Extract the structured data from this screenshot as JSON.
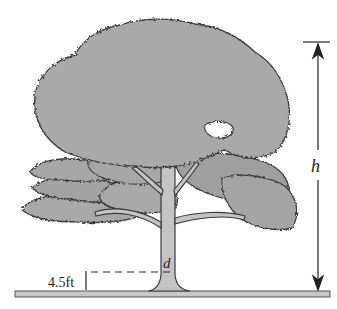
{
  "diagram": {
    "labels": {
      "height": "h",
      "diameter": "d",
      "breast_height": "4.5ft"
    },
    "colors": {
      "foliage_fill": "#a6a6a6",
      "foliage_fill_light": "#b3b3b3",
      "outline": "#3a3a3a",
      "trunk_fill": "#c4c4c4",
      "ground_fill": "#c8c8c8",
      "dimension_line": "#222222"
    }
  }
}
